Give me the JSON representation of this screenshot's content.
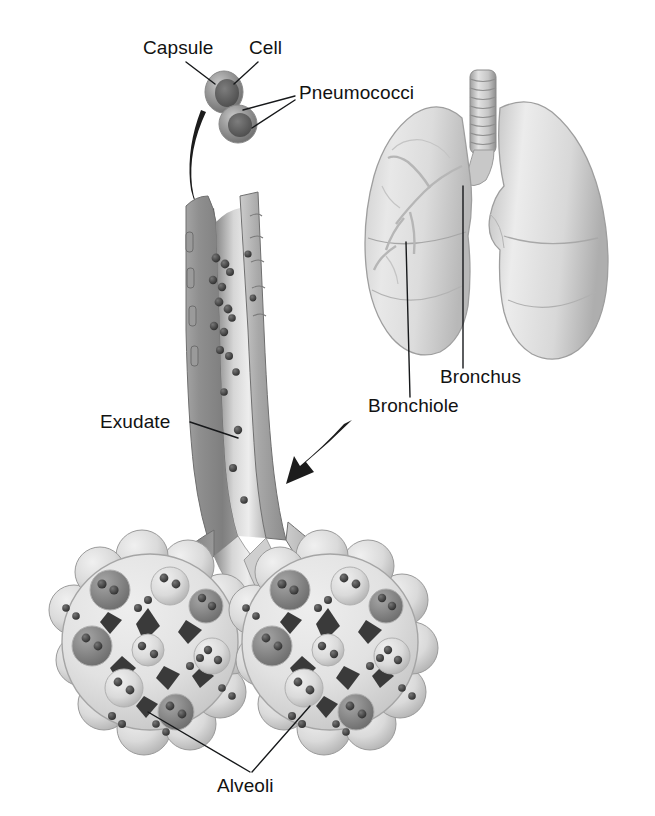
{
  "figure": {
    "background_color": "#ffffff",
    "ink_color": "#121212",
    "labels": [
      {
        "id": "capsule",
        "text": "Capsule",
        "x": 143,
        "y": 54
      },
      {
        "id": "cell",
        "text": "Cell",
        "x": 249,
        "y": 54
      },
      {
        "id": "pneumococci",
        "text": "Pneumococci",
        "x": 299,
        "y": 99
      },
      {
        "id": "bronchus",
        "text": "Bronchus",
        "x": 440,
        "y": 383
      },
      {
        "id": "bronchiole",
        "text": "Bronchiole",
        "x": 368,
        "y": 412
      },
      {
        "id": "exudate",
        "text": "Exudate",
        "x": 100,
        "y": 428
      },
      {
        "id": "alveoli",
        "text": "Alveoli",
        "x": 217,
        "y": 792
      }
    ],
    "structures": [
      {
        "id": "pneumococcus-upper",
        "name": "Pneumococcus (upper)",
        "cx": 224,
        "cy": 92
      },
      {
        "id": "pneumococcus-lower",
        "name": "Pneumococcus (lower)",
        "cx": 238,
        "cy": 124
      },
      {
        "id": "trachea",
        "name": "Trachea",
        "rings": 9
      },
      {
        "id": "lung-left",
        "name": "Left lung (viewer left)"
      },
      {
        "id": "lung-right",
        "name": "Right lung (viewer right)"
      },
      {
        "id": "bronchiole-magnified",
        "name": "Magnified cut-away bronchiole"
      },
      {
        "id": "alveolar-cluster-left",
        "name": "Alveolar cluster (left)"
      },
      {
        "id": "alveolar-cluster-right",
        "name": "Alveolar cluster (right)"
      }
    ],
    "arrows": [
      {
        "id": "arrow-inhalation",
        "name": "Arrow from pneumococci into bronchiole"
      },
      {
        "id": "arrow-magnify",
        "name": "Arrow from lungs to magnified bronchiole"
      }
    ]
  }
}
